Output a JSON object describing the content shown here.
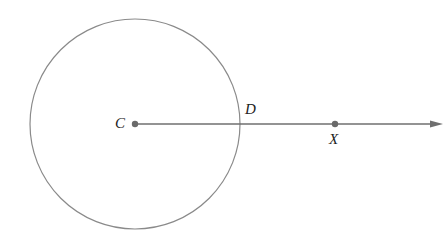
{
  "diagram": {
    "colors": {
      "stroke": "#8a8a8a",
      "ray": "#6f6f6f",
      "point": "#6a6a6a",
      "label": "#222222",
      "background": "#ffffff"
    },
    "circle": {
      "cx": 135,
      "cy": 124,
      "r": 105
    },
    "ray": {
      "from": "C",
      "through": [
        "D",
        "X"
      ],
      "x1": 135,
      "y1": 124,
      "x2": 440,
      "y2": 124
    },
    "points": [
      {
        "name": "C",
        "label": "C",
        "x": 135,
        "y": 124,
        "dot": true
      },
      {
        "name": "D",
        "label": "D",
        "x": 240,
        "y": 124,
        "dot": false
      },
      {
        "name": "X",
        "label": "X",
        "x": 335,
        "y": 124,
        "dot": true
      }
    ]
  }
}
